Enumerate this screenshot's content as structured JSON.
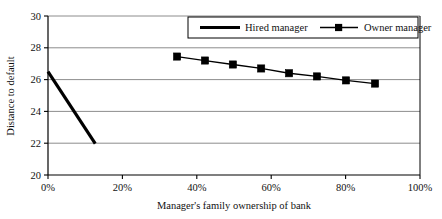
{
  "chart_data": {
    "type": "line",
    "title": "",
    "xlabel": "Manager's family ownership of bank",
    "ylabel": "Distance to default",
    "xlim": [
      0,
      100
    ],
    "ylim": [
      20,
      30
    ],
    "grid": true,
    "grid_axis": "y",
    "legend_position": "top-right-inside",
    "x_tick_labels": [
      "0%",
      "20%",
      "40%",
      "60%",
      "80%",
      "100%"
    ],
    "x_tick_values": [
      0,
      20,
      40,
      60,
      80,
      100
    ],
    "y_tick_labels": [
      "20",
      "22",
      "24",
      "26",
      "28",
      "30"
    ],
    "y_tick_values": [
      20,
      22,
      24,
      26,
      28,
      30
    ],
    "series": [
      {
        "name": "Hired manager",
        "marker": "none",
        "line_width": 3.2,
        "color": "#000000",
        "x": [
          0,
          12.7
        ],
        "y": [
          26.5,
          21.98
        ]
      },
      {
        "name": "Owner manager",
        "marker": "square",
        "line_width": 1.3,
        "color": "#000000",
        "x": [
          34.7,
          42.2,
          49.7,
          57.3,
          64.8,
          72.3,
          80.1,
          87.9
        ],
        "y": [
          27.45,
          27.2,
          26.95,
          26.7,
          26.4,
          26.2,
          25.95,
          25.75
        ]
      }
    ]
  },
  "legend": {
    "entries": [
      {
        "label": "Hired manager",
        "style": "thick-line"
      },
      {
        "label": "Owner manager",
        "style": "line-with-square-marker"
      }
    ]
  },
  "colors": {
    "axis": "#000000",
    "gridline": "#808080",
    "plot_background": "#ffffff",
    "series": "#000000"
  }
}
